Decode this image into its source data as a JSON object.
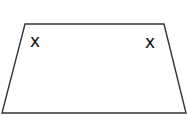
{
  "diagram": {
    "type": "trapezoid",
    "stroke_color": "#333333",
    "background": "#ffffff",
    "vertices": {
      "top_left": [
        25,
        24
      ],
      "top_right": [
        164,
        24
      ],
      "bottom_right": [
        186,
        113
      ],
      "bottom_left": [
        2,
        113
      ]
    },
    "marks": [
      {
        "label": "x",
        "position": "top-left-angle",
        "x": 36,
        "y": 46
      },
      {
        "label": "x",
        "position": "top-right-angle",
        "x": 151,
        "y": 47
      }
    ]
  }
}
